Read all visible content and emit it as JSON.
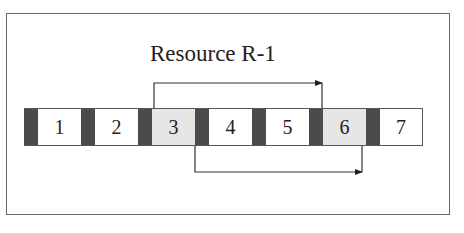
{
  "diagram": {
    "title": "Resource R-1",
    "colors": {
      "separator": "#4b4b4b",
      "shaded_cell": "#e6e6e6",
      "plain_cell": "#ffffff",
      "line": "#333333"
    },
    "cells": [
      {
        "label": "1",
        "shaded": false
      },
      {
        "label": "2",
        "shaded": false
      },
      {
        "label": "3",
        "shaded": true
      },
      {
        "label": "4",
        "shaded": false
      },
      {
        "label": "5",
        "shaded": false
      },
      {
        "label": "6",
        "shaded": true
      },
      {
        "label": "7",
        "shaded": false
      }
    ],
    "connectors": [
      {
        "name": "top-arrow",
        "from_cell": "3",
        "to_cell": "6",
        "side": "top",
        "direction": "right"
      },
      {
        "name": "bottom-arrow",
        "from_cell": "3",
        "to_cell": "6",
        "side": "bottom",
        "direction": "right"
      }
    ]
  }
}
